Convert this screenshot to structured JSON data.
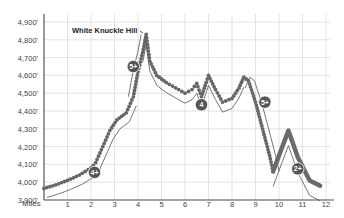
{
  "chart_data": {
    "type": "line",
    "title": "",
    "xlabel": "Miles",
    "ylabel": "",
    "xlim": [
      0,
      12
    ],
    "ylim": [
      3900,
      4900
    ],
    "grid": true,
    "x_ticks": [
      "1",
      "2",
      "3",
      "4",
      "5",
      "6",
      "7",
      "8",
      "9",
      "10",
      "11",
      "12"
    ],
    "y_ticks": [
      "4,900'",
      "4,800'",
      "4,700'",
      "4,600'",
      "4,500'",
      "4,400'",
      "4,300'",
      "4,200'",
      "4,100'",
      "4,000'",
      "3,900'"
    ],
    "annotations": [
      {
        "text": "White Knuckle Hill",
        "x": 4.3,
        "y": 4820
      }
    ],
    "difficulty_badges": [
      {
        "label": "4+",
        "x": 2.15,
        "y": 4055
      },
      {
        "label": "5+",
        "x": 3.8,
        "y": 4650
      },
      {
        "label": "4",
        "x": 6.7,
        "y": 4435
      },
      {
        "label": "5+",
        "x": 9.4,
        "y": 4450
      },
      {
        "label": "2+",
        "x": 10.8,
        "y": 4075
      }
    ],
    "series": [
      {
        "name": "Elevation profile (dotted route)",
        "style": "dotted",
        "points": [
          [
            0,
            3965
          ],
          [
            0.5,
            3985
          ],
          [
            1,
            4010
          ],
          [
            1.5,
            4040
          ],
          [
            2,
            4080
          ],
          [
            2.2,
            4110
          ],
          [
            2.5,
            4200
          ],
          [
            2.8,
            4290
          ],
          [
            3.1,
            4350
          ],
          [
            3.5,
            4390
          ],
          [
            3.8,
            4480
          ],
          [
            4.0,
            4620
          ],
          [
            4.2,
            4730
          ],
          [
            4.35,
            4830
          ],
          [
            4.5,
            4680
          ],
          [
            4.8,
            4600
          ],
          [
            5.2,
            4560
          ],
          [
            5.6,
            4530
          ],
          [
            6.0,
            4500
          ],
          [
            6.3,
            4520
          ],
          [
            6.5,
            4555
          ],
          [
            6.7,
            4480
          ],
          [
            6.9,
            4560
          ],
          [
            7.0,
            4600
          ],
          [
            7.3,
            4520
          ],
          [
            7.6,
            4450
          ],
          [
            8.0,
            4470
          ],
          [
            8.3,
            4530
          ],
          [
            8.5,
            4590
          ],
          [
            8.7,
            4570
          ],
          [
            9.0,
            4450
          ],
          [
            9.3,
            4300
          ],
          [
            9.6,
            4150
          ],
          [
            9.75,
            4060
          ]
        ]
      },
      {
        "name": "Elevation profile (bold route)",
        "style": "bold",
        "points": [
          [
            9.75,
            4060
          ],
          [
            10.0,
            4150
          ],
          [
            10.4,
            4290
          ],
          [
            10.8,
            4140
          ],
          [
            11.3,
            4010
          ],
          [
            11.75,
            3980
          ]
        ]
      }
    ]
  }
}
